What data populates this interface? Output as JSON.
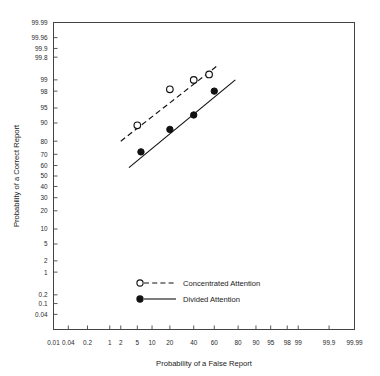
{
  "chart_data": {
    "type": "scatter",
    "title": "",
    "subtitle": "",
    "xlabel": "Probability of a False Report",
    "ylabel": "Probability of a Correct Report",
    "axis_scale": "probit",
    "grid": false,
    "xlim": [
      0.01,
      99.99
    ],
    "ylim": [
      0.04,
      99.99
    ],
    "xticks": [
      "0.01",
      "0.04",
      "0.2",
      "1",
      "2",
      "5",
      "10",
      "20",
      "40",
      "60",
      "80",
      "90",
      "95",
      "98",
      "99",
      "99.9",
      "99.99"
    ],
    "xtick_values": [
      0.01,
      0.04,
      0.2,
      1,
      2,
      5,
      10,
      20,
      40,
      60,
      80,
      90,
      95,
      98,
      99,
      99.9,
      99.99
    ],
    "yticks": [
      "99.99",
      "99.96",
      "99.9",
      "99.8",
      "99",
      "98",
      "95",
      "90",
      "80",
      "70",
      "60",
      "50",
      "40",
      "30",
      "20",
      "10",
      "5",
      "2",
      "1",
      "0.2",
      "0.1",
      "0.04"
    ],
    "ytick_values": [
      99.99,
      99.96,
      99.9,
      99.8,
      99,
      98,
      95,
      90,
      80,
      70,
      60,
      50,
      40,
      30,
      20,
      10,
      5,
      2,
      1,
      0.2,
      0.1,
      0.04
    ],
    "legend_position": "inside-bottom-center",
    "series": [
      {
        "name": "Concentrated Attention",
        "marker": "open-circle",
        "line": "dashed",
        "color": "#111111",
        "x": [
          5.0,
          20.0,
          40.0,
          55.0
        ],
        "y": [
          89.0,
          98.2,
          99.0,
          99.3
        ],
        "fit_line": {
          "x_start": 2.0,
          "x_end": 62.0,
          "y_start": 80.0,
          "y_end": 99.6
        }
      },
      {
        "name": "Divided Attention",
        "marker": "filled-circle",
        "line": "solid",
        "color": "#111111",
        "x": [
          6.0,
          20.0,
          40.0,
          60.0
        ],
        "y": [
          72.0,
          87.0,
          93.0,
          98.0
        ],
        "fit_line": {
          "x_start": 3.2,
          "x_end": 78.0,
          "y_start": 58.0,
          "y_end": 99.0
        }
      }
    ]
  },
  "legend": {
    "items": [
      {
        "label": "Concentrated Attention",
        "marker": "open-circle",
        "line": "dashed"
      },
      {
        "label": "Divided Attention",
        "marker": "filled-circle",
        "line": "solid"
      }
    ]
  },
  "axes": {
    "x_title": "Probability of a False Report",
    "y_title": "Probability of a Correct Report"
  }
}
